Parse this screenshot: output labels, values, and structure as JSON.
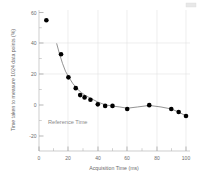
{
  "chart_data": {
    "type": "scatter",
    "title": "",
    "xlabel": "Acquisition Time (ms)",
    "ylabel": "Time taken to measure 1024 data points (%)",
    "xlim": [
      0,
      105
    ],
    "ylim": [
      -20,
      62
    ],
    "xticks": [
      0,
      20,
      40,
      60,
      80,
      100
    ],
    "xtick_labels": [
      "0",
      "20",
      "40",
      "60",
      "80",
      "100"
    ],
    "yticks": [
      -20,
      0,
      20,
      40,
      60
    ],
    "ytick_labels": [
      "-20",
      "0",
      "20",
      "40",
      "60"
    ],
    "x_minor_interval": 10,
    "y_minor_interval": 10,
    "grid": true,
    "legend": null,
    "annotations": [
      {
        "text": "Reference Time",
        "x": 6,
        "y": 0,
        "anchor": "left"
      }
    ],
    "series": [
      {
        "name": "Measured overhead",
        "marker": "circle",
        "marker_color": "#000000",
        "marker_size": 4.6,
        "x": [
          5,
          15,
          20,
          25,
          28,
          31,
          35,
          40,
          45,
          50,
          60,
          75,
          90,
          95,
          100
        ],
        "y": [
          55,
          33,
          18,
          11,
          6.5,
          5.0,
          3.5,
          0.5,
          -0.5,
          -0.5,
          -2.5,
          0.0,
          -2.5,
          -4.5,
          -7.0
        ]
      },
      {
        "name": "Fitted trend",
        "marker": "none",
        "line_color": "#6f6f6f",
        "x": [
          12,
          14,
          16,
          18,
          20,
          23,
          26,
          29,
          32,
          36,
          40,
          45,
          50,
          55,
          60,
          67,
          75,
          83,
          90,
          95,
          100
        ],
        "y": [
          40.0,
          33.0,
          27.0,
          22.0,
          18.5,
          14.0,
          10.5,
          8.0,
          6.0,
          4.0,
          2.0,
          0.2,
          -0.6,
          -1.2,
          -2.0,
          -1.2,
          -0.2,
          -1.2,
          -2.5,
          -4.5,
          -7.0
        ]
      }
    ]
  },
  "figure": {
    "background": "#ffffff",
    "axis_color": "#b9b9b9",
    "grid_color": "#e2e2e2",
    "text_color": "#6b6b6b",
    "marker_color": "#000000",
    "annotation_color": "#8a8a8a"
  }
}
